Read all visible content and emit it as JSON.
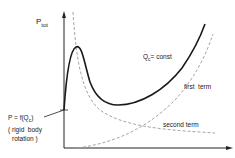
{
  "diagram": {
    "y_axis_label": "P",
    "y_axis_label_sub": "tot",
    "curve_label_main": "Q",
    "curve_label_sub": "c",
    "curve_label_suffix": "= const",
    "first_term_label": "first  term",
    "second_term_label": "second term",
    "point_label_line1": "P = f(Q",
    "point_label_sub": "c",
    "point_label_close": ")",
    "point_label_line2": "( rigid  body",
    "point_label_line3": "rotation )",
    "colors": {
      "solid_curve": "#1a1a1a",
      "dashed_curves": "#9a9a9a",
      "axes": "#222222"
    }
  }
}
